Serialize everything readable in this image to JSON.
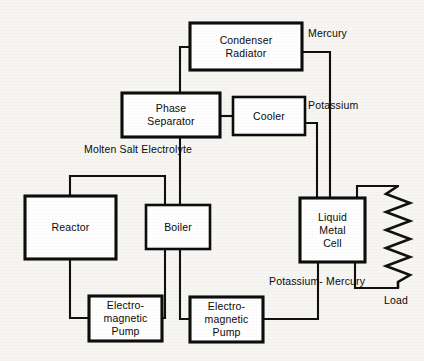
{
  "diagram": {
    "stroke_color": "#111111",
    "background_color": "#f7f6f2",
    "box_fill": "#ffffff",
    "boxes": [
      {
        "id": "condenser-radiator",
        "lines": [
          "Condenser",
          "Radiator"
        ],
        "x": 190,
        "y": 23,
        "w": 112,
        "h": 47
      },
      {
        "id": "phase-separator",
        "lines": [
          "Phase",
          "Separator"
        ],
        "x": 122,
        "y": 93,
        "w": 98,
        "h": 44
      },
      {
        "id": "cooler",
        "lines": [
          "Cooler"
        ],
        "x": 233,
        "y": 97,
        "w": 72,
        "h": 38
      },
      {
        "id": "reactor",
        "lines": [
          "Reactor"
        ],
        "x": 25,
        "y": 196,
        "w": 91,
        "h": 63
      },
      {
        "id": "boiler",
        "lines": [
          "Boiler"
        ],
        "x": 146,
        "y": 205,
        "w": 64,
        "h": 44
      },
      {
        "id": "liquid-metal-cell",
        "lines": [
          "Liquid",
          "Metal",
          "Cell"
        ],
        "x": 300,
        "y": 198,
        "w": 65,
        "h": 64
      },
      {
        "id": "electromagnetic-pump-left",
        "lines": [
          "Electro-",
          "magnetic",
          "Pump"
        ],
        "x": 89,
        "y": 296,
        "w": 73,
        "h": 45
      },
      {
        "id": "electromagnetic-pump-right",
        "lines": [
          "Electro-",
          "magnetic",
          "Pump"
        ],
        "x": 190,
        "y": 297,
        "w": 73,
        "h": 45
      }
    ],
    "annotations": [
      {
        "id": "mercury",
        "lines": [
          "Mercury"
        ],
        "x": 308,
        "y": 27,
        "align": "left"
      },
      {
        "id": "potassium",
        "lines": [
          "Potassium"
        ],
        "x": 308,
        "y": 99,
        "align": "left"
      },
      {
        "id": "molten-salt-electrolyte",
        "lines": [
          "Molten Salt",
          "Electrolyte"
        ],
        "x": 84,
        "y": 143,
        "align": "left"
      },
      {
        "id": "potassium-mercury",
        "lines": [
          "Potassium-",
          "Mercury"
        ],
        "x": 269,
        "y": 275,
        "align": "left"
      },
      {
        "id": "load",
        "lines": [
          "Load"
        ],
        "x": 384,
        "y": 294,
        "align": "left"
      }
    ],
    "components": [
      {
        "id": "load-resistor",
        "type": "zigzag-resistor",
        "x": 385,
        "y": 185,
        "w": 26,
        "h": 96
      }
    ]
  }
}
